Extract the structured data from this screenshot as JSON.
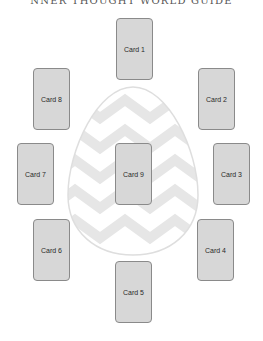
{
  "title": "NNER THOUGHT WORLD GUIDE",
  "colors": {
    "card_fill": "#d7d7d7",
    "card_border": "#8a8a8a",
    "egg_stripe": "#e6e6e6",
    "egg_outline": "#dedede",
    "background": "#ffffff"
  },
  "center_shape": "easter-egg-zigzag",
  "cards": [
    {
      "label": "Card 1",
      "x": 116,
      "y": 18
    },
    {
      "label": "Card 2",
      "x": 198,
      "y": 68
    },
    {
      "label": "Card 3",
      "x": 213,
      "y": 143
    },
    {
      "label": "Card 4",
      "x": 197,
      "y": 219
    },
    {
      "label": "Card 5",
      "x": 115,
      "y": 261
    },
    {
      "label": "Card 6",
      "x": 33,
      "y": 219
    },
    {
      "label": "Card 7",
      "x": 17,
      "y": 143
    },
    {
      "label": "Card 8",
      "x": 33,
      "y": 68
    },
    {
      "label": "Card 9",
      "x": 115,
      "y": 143
    }
  ]
}
